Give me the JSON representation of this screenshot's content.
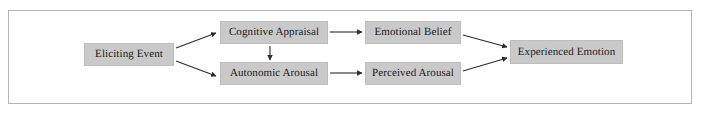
{
  "figure": {
    "type": "flow-diagram",
    "frame": {
      "border_color": "#b4b4b4",
      "background": "#ffffff"
    },
    "style": {
      "node_fill": "#c9c9c9",
      "node_border": "#bdbdbd",
      "text_color": "#1a1a1a",
      "arrow_color": "#2b2b2b"
    }
  },
  "nodes": [
    {
      "id": "eliciting-event",
      "label": "Eliciting Event"
    },
    {
      "id": "cognitive-appraisal",
      "label": "Cognitive Appraisal"
    },
    {
      "id": "autonomic-arousal",
      "label": "Autonomic Arousal"
    },
    {
      "id": "emotional-belief",
      "label": "Emotional Belief"
    },
    {
      "id": "perceived-arousal",
      "label": "Perceived Arousal"
    },
    {
      "id": "experienced-emotion",
      "label": "Experienced Emotion"
    }
  ],
  "edges": [
    {
      "id": "edge-eliciting-to-cognitive",
      "from": "eliciting-event",
      "to": "cognitive-appraisal",
      "direction": "up-right"
    },
    {
      "id": "edge-eliciting-to-autonomic",
      "from": "eliciting-event",
      "to": "autonomic-arousal",
      "direction": "down-right"
    },
    {
      "id": "edge-cognitive-to-autonomic",
      "from": "cognitive-appraisal",
      "to": "autonomic-arousal",
      "direction": "down"
    },
    {
      "id": "edge-cognitive-to-belief",
      "from": "cognitive-appraisal",
      "to": "emotional-belief",
      "direction": "right"
    },
    {
      "id": "edge-autonomic-to-perceived",
      "from": "autonomic-arousal",
      "to": "perceived-arousal",
      "direction": "right"
    },
    {
      "id": "edge-belief-to-experienced",
      "from": "emotional-belief",
      "to": "experienced-emotion",
      "direction": "down-right"
    },
    {
      "id": "edge-perceived-to-experienced",
      "from": "perceived-arousal",
      "to": "experienced-emotion",
      "direction": "up-right"
    }
  ]
}
